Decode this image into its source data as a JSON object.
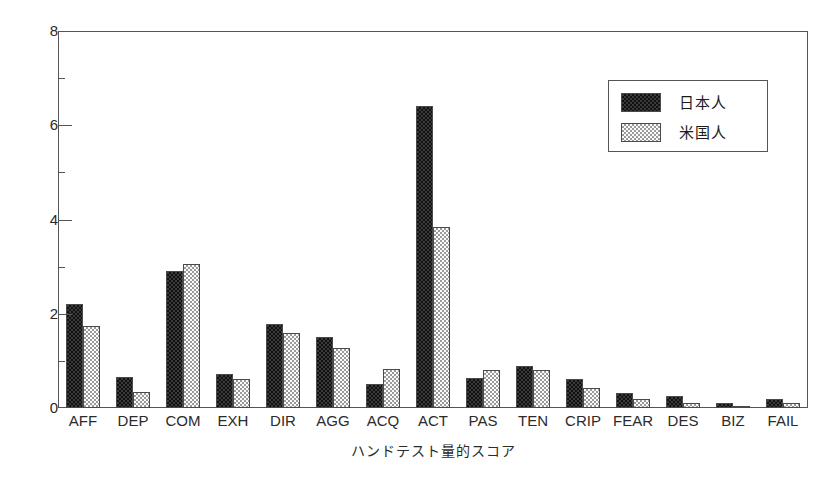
{
  "chart_data": {
    "type": "bar",
    "title": "",
    "subtitle": "",
    "xlabel": "ハンドテスト量的スコア",
    "ylabel": "",
    "ylim": [
      0,
      8
    ],
    "y_ticks": [
      0,
      2,
      4,
      6,
      8
    ],
    "y_minor_ticks": [
      1,
      3,
      5,
      7
    ],
    "y_tick_labels": [
      "0",
      "2",
      "4",
      "6",
      "8"
    ],
    "grid": false,
    "legend_position": "top-right",
    "categories": [
      "AFF",
      "DEP",
      "COM",
      "EXH",
      "DIR",
      "AGG",
      "ACQ",
      "ACT",
      "PAS",
      "TEN",
      "CRIP",
      "FEAR",
      "DES",
      "BIZ",
      "FAIL"
    ],
    "series": [
      {
        "name": "日本人",
        "pattern": "dark-checker",
        "color": "#3a3a3a",
        "values": [
          2.2,
          0.65,
          2.9,
          0.73,
          1.78,
          1.5,
          0.52,
          6.4,
          0.63,
          0.9,
          0.62,
          0.32,
          0.25,
          0.1,
          0.2
        ]
      },
      {
        "name": "米国人",
        "pattern": "light-checker",
        "color": "#e8e8e8",
        "values": [
          1.75,
          0.35,
          3.05,
          0.62,
          1.6,
          1.27,
          0.82,
          3.85,
          0.8,
          0.8,
          0.42,
          0.2,
          0.1,
          0.04,
          0.1
        ]
      }
    ]
  },
  "legend": {
    "entries": [
      {
        "label": "日本人"
      },
      {
        "label": "米国人"
      }
    ]
  },
  "axes": {
    "x_title": "ハンドテスト量的スコア"
  }
}
